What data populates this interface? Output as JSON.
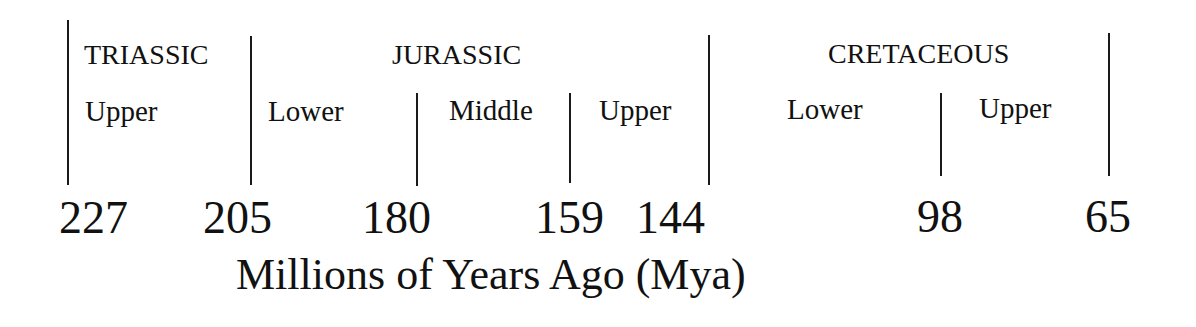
{
  "timeline": {
    "axis_title": "Millions of Years Ago (Mya)",
    "periods": [
      {
        "name": "TRIASSIC",
        "start_mya": 227,
        "end_mya": 205
      },
      {
        "name": "JURASSIC",
        "start_mya": 205,
        "end_mya": 144
      },
      {
        "name": "CRETACEOUS",
        "start_mya": 144,
        "end_mya": 65
      }
    ],
    "epochs": [
      {
        "name": "Upper",
        "period": "TRIASSIC",
        "start_mya": 227,
        "end_mya": 205
      },
      {
        "name": "Lower",
        "period": "JURASSIC",
        "start_mya": 205,
        "end_mya": 180
      },
      {
        "name": "Middle",
        "period": "JURASSIC",
        "start_mya": 180,
        "end_mya": 159
      },
      {
        "name": "Upper",
        "period": "JURASSIC",
        "start_mya": 159,
        "end_mya": 144
      },
      {
        "name": "Lower",
        "period": "CRETACEOUS",
        "start_mya": 144,
        "end_mya": 98
      },
      {
        "name": "Upper",
        "period": "CRETACEOUS",
        "start_mya": 98,
        "end_mya": 65
      }
    ],
    "ticks": [
      "227",
      "205",
      "180",
      "159",
      "144",
      "98",
      "65"
    ],
    "colors": {
      "ink": "#111111",
      "background": "#ffffff"
    }
  }
}
